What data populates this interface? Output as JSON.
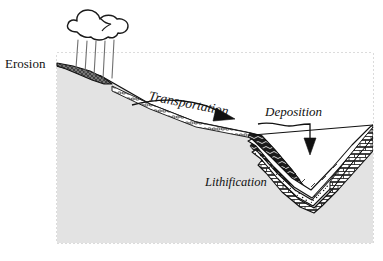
{
  "figure": {
    "type": "geological-cross-section",
    "frame": {
      "border_style": "dashed",
      "border_color": "#b8b8b8",
      "fill_color": "#e3e3e3"
    }
  },
  "labels": {
    "erosion": "Erosion",
    "transportation": "Transportation",
    "deposition": "Deposition",
    "lithification": "Lithification"
  },
  "icons": {
    "cloud": "rain-cloud-icon",
    "rain": "rain-streaks-icon",
    "transport_arrow": "curved-right-arrow-icon",
    "deposition_arrow": "down-arrow-icon"
  },
  "colors": {
    "ground": "#e3e3e3",
    "ground_outline": "#1a1a1a",
    "erosion_wedge": "#6b6b6b",
    "stroke": "#111111",
    "white": "#ffffff",
    "dark_band": "#1a1a1a",
    "frame_dash": "#b8b8b8"
  },
  "strata": [
    {
      "name": "limestone-brick-layer",
      "pattern": "brick",
      "fill": "#ffffff"
    },
    {
      "name": "sandstone-stipple-layer",
      "pattern": "stipple",
      "fill": "#ffffff"
    },
    {
      "name": "upper-white-layer",
      "pattern": "plain",
      "fill": "#ffffff"
    },
    {
      "name": "shale-dark-band-layer",
      "pattern": "wavy-dark",
      "fill": "#1a1a1a"
    },
    {
      "name": "pebble-channel-layer",
      "pattern": "pebbles",
      "fill": "#ffffff"
    }
  ]
}
